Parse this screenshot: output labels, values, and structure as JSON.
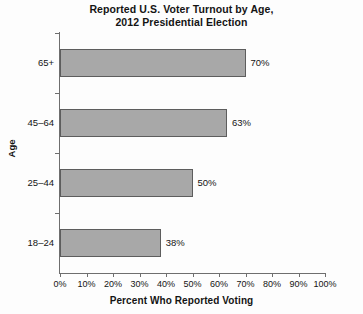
{
  "chart_data": {
    "type": "bar",
    "orientation": "horizontal",
    "title": "Reported U.S. Voter Turnout by Age, 2012 Presidential Election",
    "title_lines": [
      "Reported U.S. Voter Turnout by Age,",
      "2012 Presidential Election"
    ],
    "categories": [
      "18–24",
      "25–44",
      "45–64",
      "65+"
    ],
    "values": [
      38,
      50,
      63,
      70
    ],
    "value_labels": [
      "38%",
      "50%",
      "63%",
      "70%"
    ],
    "xlabel": "Percent Who Reported Voting",
    "ylabel": "Age",
    "xlim": [
      0,
      100
    ],
    "xticks": [
      0,
      10,
      20,
      30,
      40,
      50,
      60,
      70,
      80,
      90,
      100
    ],
    "xtick_labels": [
      "0%",
      "10%",
      "20%",
      "30%",
      "40%",
      "50%",
      "60%",
      "70%",
      "80%",
      "90%",
      "100%"
    ],
    "grid": false,
    "legend": false,
    "bar_fill_color": "#a8a8a8",
    "bar_edge_color": "#5d5d5d",
    "axis_color": "#6e6e6e",
    "background_color": "#fdfdfd",
    "text_color": "#141414"
  }
}
